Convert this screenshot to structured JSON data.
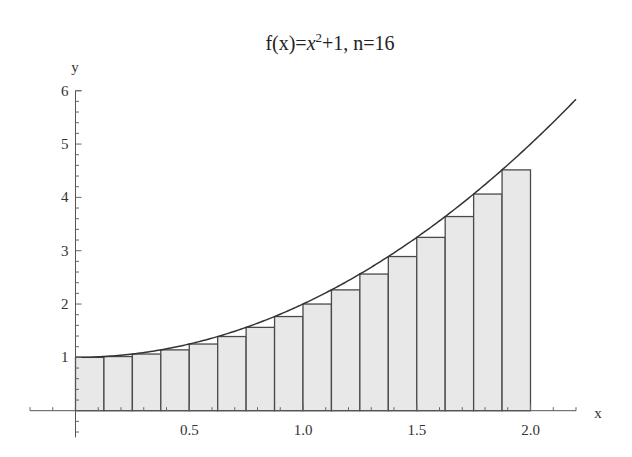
{
  "chart_data": {
    "type": "bar",
    "subtype": "left-riemann-sum-with-curve",
    "title_parts": {
      "prefix": "f(x)=",
      "var": "x",
      "exp": "2",
      "suffix": "+1, n=16"
    },
    "xlabel": "x",
    "ylabel": "y",
    "function": "x^2+1",
    "n": 16,
    "interval": [
      0,
      2
    ],
    "xlim": [
      -0.2,
      2.2
    ],
    "ylim": [
      -0.5,
      6
    ],
    "grid": false,
    "legend": null,
    "x_ticks": [
      {
        "value": 0.5,
        "label": "0.5"
      },
      {
        "value": 1.0,
        "label": "1.0"
      },
      {
        "value": 1.5,
        "label": "1.5"
      },
      {
        "value": 2.0,
        "label": "2.0"
      }
    ],
    "y_ticks": [
      {
        "value": 1,
        "label": "1"
      },
      {
        "value": 2,
        "label": "2"
      },
      {
        "value": 3,
        "label": "3"
      },
      {
        "value": 4,
        "label": "4"
      },
      {
        "value": 5,
        "label": "5"
      },
      {
        "value": 6,
        "label": "6"
      }
    ],
    "bar_width": 0.125,
    "x": [
      0,
      0.125,
      0.25,
      0.375,
      0.5,
      0.625,
      0.75,
      0.875,
      1.0,
      1.125,
      1.25,
      1.375,
      1.5,
      1.625,
      1.75,
      1.875
    ],
    "values": [
      1,
      1.015625,
      1.0625,
      1.140625,
      1.25,
      1.390625,
      1.5625,
      1.765625,
      2,
      2.265625,
      2.5625,
      2.890625,
      3.25,
      3.640625,
      4.0625,
      4.515625
    ],
    "curve": {
      "x_range": [
        0,
        2.2
      ],
      "label": "f(x)=x^2+1"
    },
    "colors": {
      "bar_fill": "#e8e8e8",
      "bar_stroke": "#4a4a4a",
      "curve": "#333333",
      "axis": "#555555"
    }
  }
}
